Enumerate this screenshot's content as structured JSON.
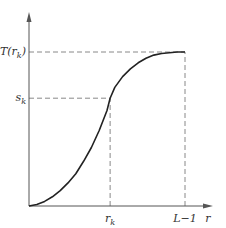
{
  "chart_data": {
    "type": "line",
    "title": "",
    "xlabel": "r",
    "ylabel": "",
    "x_ticks": [
      {
        "label": "r",
        "sub": "k",
        "value": 0.52
      },
      {
        "label": "L−1",
        "sub": "",
        "value": 1.0
      }
    ],
    "y_ticks": [
      {
        "label": "T(r",
        "sub": "k",
        "tail": ")",
        "value": 1.0
      },
      {
        "label": "s",
        "sub": "k",
        "value": 0.7
      }
    ],
    "xlim": [
      0,
      1.17
    ],
    "ylim": [
      0,
      1.24
    ],
    "grid": false,
    "legend": "none",
    "series": [
      {
        "name": "T(r)",
        "x": [
          0,
          0.05,
          0.1,
          0.15,
          0.2,
          0.25,
          0.3,
          0.35,
          0.4,
          0.45,
          0.5,
          0.52,
          0.55,
          0.6,
          0.65,
          0.7,
          0.75,
          0.8,
          0.85,
          0.9,
          0.95,
          1.0
        ],
        "y": [
          0,
          0.01,
          0.03,
          0.06,
          0.1,
          0.15,
          0.21,
          0.29,
          0.38,
          0.49,
          0.62,
          0.7,
          0.77,
          0.84,
          0.89,
          0.93,
          0.96,
          0.98,
          0.99,
          0.995,
          1.0,
          1.0
        ]
      }
    ],
    "guides": [
      {
        "type": "horizontal",
        "y": 1.0,
        "x_to": 1.0
      },
      {
        "type": "horizontal",
        "y": 0.7,
        "x_to": 0.52
      },
      {
        "type": "vertical",
        "x": 0.52,
        "y_to": 0.7
      },
      {
        "type": "vertical",
        "x": 1.0,
        "y_to": 1.0
      }
    ],
    "colors": {
      "curve": "#222222",
      "axis": "#555555",
      "guide": "#888888"
    }
  }
}
